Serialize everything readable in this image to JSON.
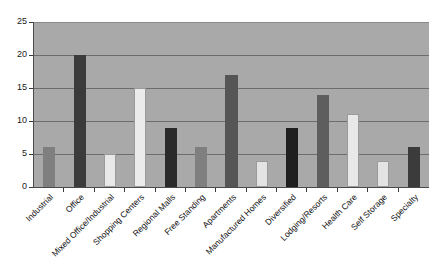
{
  "chart_data": {
    "type": "bar",
    "title": "",
    "subtitle": "",
    "xlabel": "",
    "ylabel": "",
    "ylim": [
      0,
      25
    ],
    "ytick_values": [
      0,
      5,
      10,
      15,
      20,
      25
    ],
    "ytick_labels": [
      "0",
      "5",
      "10",
      "15",
      "20",
      "25"
    ],
    "grid": "horizontal",
    "legend": "none",
    "plot_background": "#a9a9a9",
    "figure_background": "#ffffff",
    "categories": [
      "Industrial",
      "Office",
      "Mixed Office/Industrial",
      "Shopping Centers",
      "Regional Malls",
      "Free Standing",
      "Apartments",
      "Manufactured Homes",
      "Diversified",
      "Lodging/Resorts",
      "Health Care",
      "Self Storage",
      "Specialty"
    ],
    "values": [
      6,
      20,
      5,
      15,
      9,
      6,
      17,
      4,
      9,
      14,
      11,
      4,
      6
    ],
    "bar_colors": [
      "#7f7f7f",
      "#3b3b3b",
      "#e8e8e8",
      "#ebebeb",
      "#2a2a2a",
      "#7f7f7f",
      "#555555",
      "#e3e3e3",
      "#1f1f1f",
      "#5e5e5e",
      "#e8e8e8",
      "#e3e3e3",
      "#3b3b3b"
    ],
    "bars": [
      {
        "category": "Industrial",
        "value": 6,
        "color": "#7f7f7f"
      },
      {
        "category": "Office",
        "value": 20,
        "color": "#3b3b3b"
      },
      {
        "category": "Mixed Office/Industrial",
        "value": 5,
        "color": "#e8e8e8"
      },
      {
        "category": "Shopping Centers",
        "value": 15,
        "color": "#ebebeb"
      },
      {
        "category": "Regional Malls",
        "value": 9,
        "color": "#2a2a2a"
      },
      {
        "category": "Free Standing",
        "value": 6,
        "color": "#7f7f7f"
      },
      {
        "category": "Apartments",
        "value": 17,
        "color": "#555555"
      },
      {
        "category": "Manufactured Homes",
        "value": 4,
        "color": "#e3e3e3"
      },
      {
        "category": "Diversified",
        "value": 9,
        "color": "#1f1f1f"
      },
      {
        "category": "Lodging/Resorts",
        "value": 14,
        "color": "#5e5e5e"
      },
      {
        "category": "Health Care",
        "value": 11,
        "color": "#e8e8e8"
      },
      {
        "category": "Self Storage",
        "value": 4,
        "color": "#e3e3e3"
      },
      {
        "category": "Specialty",
        "value": 6,
        "color": "#3b3b3b"
      }
    ]
  }
}
